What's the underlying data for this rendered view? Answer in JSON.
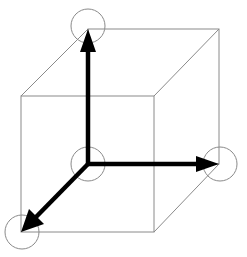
{
  "diagram": {
    "type": "unit-cube-basis-vectors",
    "colors": {
      "background": "#ffffff",
      "cube_edge": "#8a8a8a",
      "circle": "#8a8a8a",
      "arrow": "#000000"
    },
    "cube": {
      "front_face": {
        "x1": 21,
        "y1": 96,
        "x2": 154,
        "y2": 232
      },
      "back_face": {
        "x1": 88,
        "y1": 29,
        "x2": 219,
        "y2": 164
      }
    },
    "origin": {
      "x": 88,
      "y": 164
    },
    "arrows": [
      {
        "name": "up-arrow",
        "direction": "up",
        "to": {
          "x": 88,
          "y": 29
        }
      },
      {
        "name": "right-arrow",
        "direction": "right",
        "to": {
          "x": 219,
          "y": 164
        }
      },
      {
        "name": "down-left-arrow",
        "direction": "down-left",
        "to": {
          "x": 21,
          "y": 232
        }
      }
    ],
    "circles": [
      {
        "name": "top-vertex-circle",
        "cx": 88,
        "cy": 26,
        "r": 17
      },
      {
        "name": "origin-circle",
        "cx": 88,
        "cy": 164,
        "r": 17
      },
      {
        "name": "right-vertex-circle",
        "cx": 220,
        "cy": 164,
        "r": 17
      },
      {
        "name": "bottom-left-vertex-circle",
        "cx": 22,
        "cy": 232,
        "r": 17
      }
    ]
  }
}
